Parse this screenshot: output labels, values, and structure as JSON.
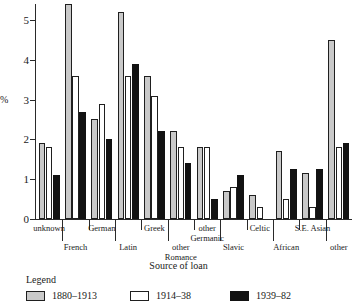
{
  "chart_data": {
    "type": "bar",
    "title": "",
    "xlabel": "Source of loan",
    "ylabel": "%",
    "ylim": [
      0,
      5.4
    ],
    "yticks": [
      0,
      1,
      2,
      3,
      4,
      5
    ],
    "ytick_labels": [
      "0",
      "1",
      "2",
      "3",
      "4",
      "5"
    ],
    "grid": false,
    "legend_position": "below",
    "legend_title": "Legend",
    "categories": [
      "unknown",
      "French",
      "German",
      "Latin",
      "Greek",
      "other Romance",
      "other Germanic",
      "Slavic",
      "Celtic",
      "African",
      "S.E. Asian",
      "other"
    ],
    "category_label_lines": [
      [
        "unknown"
      ],
      [
        "French"
      ],
      [
        "German"
      ],
      [
        "Latin"
      ],
      [
        "Greek"
      ],
      [
        "other",
        "Romance"
      ],
      [
        "other",
        "Germanic"
      ],
      [
        "Slavic"
      ],
      [
        "Celtic"
      ],
      [
        "African"
      ],
      [
        "S.E. Asian"
      ],
      [
        "other"
      ]
    ],
    "series": [
      {
        "name": "1880-1913",
        "color": "#c9c9c9",
        "values": [
          1.9,
          5.55,
          2.5,
          5.2,
          3.6,
          2.2,
          1.8,
          0.7,
          0.6,
          1.7,
          1.15,
          4.5
        ]
      },
      {
        "name": "1914-38",
        "color": "#ffffff",
        "values": [
          1.8,
          3.6,
          2.9,
          3.6,
          3.1,
          1.8,
          1.8,
          0.8,
          0.3,
          0.5,
          0.3,
          1.8
        ]
      },
      {
        "name": "1939-82",
        "color": "#121212",
        "values": [
          1.1,
          2.7,
          2.0,
          3.9,
          2.2,
          1.4,
          0.5,
          1.1,
          0.0,
          1.25,
          1.25,
          1.9
        ]
      }
    ]
  },
  "legend": {
    "title": "Legend",
    "items": [
      {
        "label": "1880–1913",
        "swatch": "gray"
      },
      {
        "label": "1914–38",
        "swatch": "white"
      },
      {
        "label": "1939–82",
        "swatch": "black"
      }
    ]
  },
  "axes": {
    "y_title": "%",
    "x_title": "Source of loan"
  }
}
